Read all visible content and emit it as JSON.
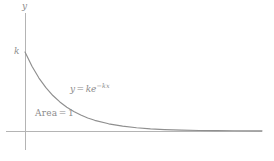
{
  "figure": {
    "background_color": "#ffffff",
    "axis_color": "#b0b0b0",
    "curve_color": "#8f8f8f",
    "text_color": "#8c8c8c",
    "y_axis_label": "y",
    "intercept_label": "k",
    "area_label_text": "Area",
    "area_equals_sign": "=",
    "area_value": "1",
    "equation": {
      "lhs": "y",
      "equals": "=",
      "coefficient": "k",
      "base": "e",
      "exponent": "−kx",
      "full": "y = ke^{-kx}"
    }
  },
  "chart_data": {
    "type": "line",
    "title": "",
    "subtitle": "",
    "xlabel": "",
    "ylabel": "y",
    "legend": [],
    "legend_position": "none",
    "grid": false,
    "annotations": [
      {
        "name": "y-axis-label",
        "text": "y",
        "x_px": 22,
        "y_px": 2
      },
      {
        "name": "y-intercept-tick-label",
        "text": "k",
        "x_px": 14,
        "y_px": 47
      },
      {
        "name": "curve-equation",
        "text": "y = ke^{-kx}",
        "x_px": 70,
        "y_px": 83
      },
      {
        "name": "area-under-curve",
        "text": "Area = 1",
        "x_px": 35,
        "y_px": 109
      }
    ],
    "axes": {
      "x_axis": {
        "visible": true,
        "ticks": [],
        "tick_labels": [],
        "range": [
          0,
          6.8
        ],
        "origin_px": [
          25,
          131
        ],
        "end_px": [
          262,
          131
        ]
      },
      "y_axis": {
        "visible": true,
        "ticks": [
          "k"
        ],
        "tick_labels": [
          "k"
        ],
        "range": [
          0,
          1.0
        ],
        "top_px": [
          25,
          13
        ],
        "bottom_px": [
          25,
          150
        ]
      }
    },
    "function": "y = k*exp(-k*x)",
    "parameters": {
      "k": 1
    },
    "x": [
      0,
      0.2,
      0.4,
      0.6,
      0.8,
      1.0,
      1.2,
      1.4,
      1.6,
      1.8,
      2.0,
      2.4,
      2.8,
      3.2,
      3.6,
      4.0,
      4.5,
      5.0,
      5.5,
      6.0,
      6.8
    ],
    "y": [
      1.0,
      0.819,
      0.67,
      0.549,
      0.449,
      0.368,
      0.301,
      0.247,
      0.202,
      0.165,
      0.135,
      0.091,
      0.061,
      0.041,
      0.027,
      0.018,
      0.011,
      0.0067,
      0.0041,
      0.0025,
      0.0011
    ],
    "series": [
      {
        "name": "exponential-density",
        "values": [
          1.0,
          0.819,
          0.67,
          0.549,
          0.449,
          0.368,
          0.301,
          0.247,
          0.202,
          0.165,
          0.135,
          0.091,
          0.061,
          0.041,
          0.027,
          0.018,
          0.011,
          0.0067,
          0.0041,
          0.0025,
          0.0011
        ],
        "color": "#8f8f8f"
      }
    ],
    "shaded_region": {
      "label": "Area = 1",
      "value": 1
    },
    "xlim": [
      0,
      6.8
    ],
    "ylim": [
      0,
      1.05
    ]
  }
}
